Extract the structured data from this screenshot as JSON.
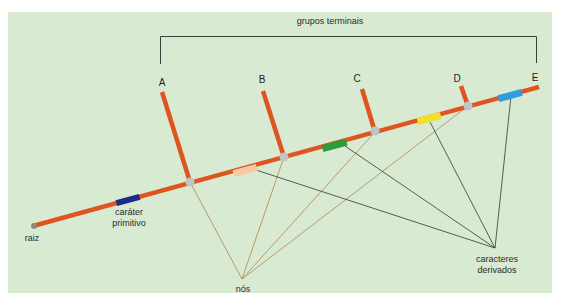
{
  "diagram": {
    "type": "cladogram",
    "colors": {
      "background": "#d8ebd2",
      "branch": "#e0541f",
      "node": "#bfc4c6",
      "node_pointer_line": "#b5824e",
      "derived_pointer_line": "#2f3a33",
      "bracket": "#3a3f3a"
    },
    "bracket_label": "grupos terminais",
    "root_label": "raiz",
    "primitive_label": [
      "caráter",
      "primitivo"
    ],
    "nodes_label": "nós",
    "derived_label": [
      "caracteres",
      "derivados"
    ],
    "taxa": [
      {
        "id": "A",
        "label": "A"
      },
      {
        "id": "B",
        "label": "B"
      },
      {
        "id": "C",
        "label": "C"
      },
      {
        "id": "D",
        "label": "D"
      },
      {
        "id": "E",
        "label": "E"
      }
    ],
    "character_markers": [
      {
        "name": "primitive",
        "color": "#1c2a8a"
      },
      {
        "name": "derived-1",
        "color": "#f6c9a0"
      },
      {
        "name": "derived-2",
        "color": "#2e9a3e"
      },
      {
        "name": "derived-3",
        "color": "#f2e02a"
      },
      {
        "name": "derived-4",
        "color": "#2f9ee0"
      }
    ]
  }
}
